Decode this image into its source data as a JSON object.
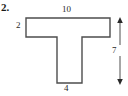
{
  "figure": {
    "problem_number": "2.",
    "shape_name": "t-shape-polygon",
    "outline_color": "#4d4d4d",
    "fill_color": "#ffffff",
    "text_color": "#2a2a2a",
    "labels": {
      "top_width": "10",
      "left_height": "2",
      "right_total_height": "7",
      "bottom_width": "4"
    },
    "dimension_arrow": {
      "name": "right-height-arrow",
      "orientation": "vertical",
      "double_headed": true,
      "value": "7"
    }
  }
}
